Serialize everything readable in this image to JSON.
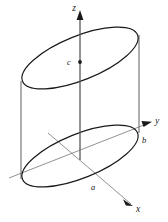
{
  "figure": {
    "kind": "oblique-elliptical-cylinder-3d-axes",
    "background_color": "#ffffff",
    "outline_color": "#1a1a1a",
    "axis_color": "#6e6e6e",
    "axis_arrow_color": "#1a1a1a",
    "labels": {
      "z_axis": "z",
      "y_axis": "y",
      "x_axis": "x",
      "center_point": "c",
      "y_intercept": "b",
      "x_intercept": "a"
    },
    "geometry": {
      "top_ellipse": {
        "center_x": 80,
        "center_y": 58,
        "semi_major": 62,
        "semi_minor": 22,
        "rotation_deg": -22
      },
      "bottom_ellipse": {
        "center_x": 80,
        "center_y": 156,
        "semi_major": 62,
        "semi_minor": 22,
        "rotation_deg": -22
      },
      "cylinder_height": 98,
      "left_wall_x": 21,
      "right_wall_x": 139,
      "origin_x": 80,
      "origin_y": 156,
      "z_axis_top_y": 10,
      "point_c_y": 62
    },
    "label_positions": {
      "z": {
        "x": 74,
        "y": 11
      },
      "y": {
        "x": 155,
        "y": 123
      },
      "x": {
        "x": 133,
        "y": 210
      },
      "c": {
        "x": 62,
        "y": 66
      },
      "b": {
        "x": 141,
        "y": 141
      },
      "a": {
        "x": 92,
        "y": 188
      }
    }
  }
}
